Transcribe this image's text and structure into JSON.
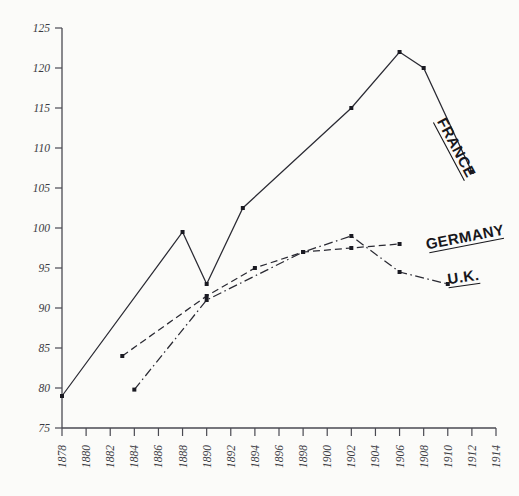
{
  "chart_data": {
    "type": "line",
    "title": "",
    "subtitle": "",
    "xlabel": "",
    "ylabel": "",
    "xlim": [
      1878,
      1914
    ],
    "ylim": [
      75,
      125
    ],
    "grid": false,
    "legend_position": "inline-end-of-line",
    "x_tick_labels": [
      "1878",
      "1880",
      "1882",
      "1884",
      "1886",
      "1888",
      "1890",
      "1892",
      "1894",
      "1896",
      "1898",
      "1900",
      "1902",
      "1904",
      "1906",
      "1908",
      "1910",
      "1912",
      "1914"
    ],
    "x_tick_values": [
      1878,
      1880,
      1882,
      1884,
      1886,
      1888,
      1890,
      1892,
      1894,
      1896,
      1898,
      1900,
      1902,
      1904,
      1906,
      1908,
      1910,
      1912,
      1914
    ],
    "y_tick_labels": [
      "125",
      "120",
      "115",
      "110",
      "105",
      "100",
      "95",
      "90",
      "85",
      "80",
      "75"
    ],
    "y_tick_values": [
      125,
      120,
      115,
      110,
      105,
      100,
      95,
      90,
      85,
      80,
      75
    ],
    "series": [
      {
        "name": "FRANCE",
        "style": "solid",
        "markers": true,
        "x": [
          1878,
          1888,
          1890,
          1893,
          1902,
          1906,
          1908,
          1912
        ],
        "values": [
          79,
          99.5,
          93,
          102.5,
          115,
          122,
          120,
          107
        ]
      },
      {
        "name": "GERMANY",
        "style": "dashed",
        "markers": true,
        "x": [
          1883,
          1890,
          1894,
          1898,
          1902,
          1906
        ],
        "values": [
          84,
          91.5,
          95,
          97,
          97.5,
          98
        ]
      },
      {
        "name": "U.K.",
        "style": "dash-dot",
        "markers": true,
        "x": [
          1884,
          1890,
          1898,
          1902,
          1906,
          1910
        ],
        "values": [
          79.8,
          91,
          97,
          99,
          94.5,
          93
        ]
      }
    ]
  },
  "series_labels": {
    "france": "FRANCE",
    "germany": "GERMANY",
    "uk": "U.K."
  },
  "colors": {
    "background": "#fbfbf9",
    "axis": "#4a4a52",
    "line": "#2a2a33",
    "text": "#17171c",
    "tick_text": "#3a3a42"
  }
}
